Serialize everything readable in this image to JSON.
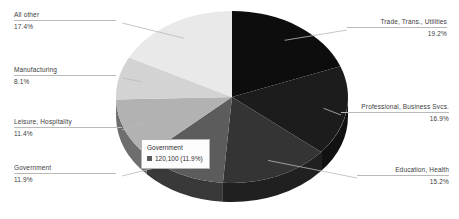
{
  "chart_data": {
    "type": "pie",
    "title": "",
    "subtitle": "",
    "legend_position": "callouts",
    "three_d": true,
    "categories": [
      "Trade, Trans., Utilities",
      "Professional, Business Svcs.",
      "Education, Health",
      "Government",
      "Leisure, Hospitality",
      "Manufacturing",
      "All other"
    ],
    "values": [
      19.2,
      16.9,
      15.2,
      11.9,
      11.4,
      8.1,
      17.4
    ],
    "value_labels": [
      "19.2%",
      "16.9%",
      "15.2%",
      "11.9%",
      "11.4%",
      "8.1%",
      "17.4%"
    ],
    "colors": [
      "#0d0d0d",
      "#1c1c1c",
      "#343434",
      "#5c5c5c",
      "#b2b2b2",
      "#d3d3d3",
      "#e9e9e9"
    ],
    "units": "percent of total"
  },
  "slices": [
    {
      "name": "Trade, Trans., Utilities",
      "pct": "19.2%",
      "color": "#0d0d0d",
      "side": "right"
    },
    {
      "name": "Professional, Business Svcs.",
      "pct": "16.9%",
      "color": "#1c1c1c",
      "side": "right"
    },
    {
      "name": "Education, Health",
      "pct": "15.2%",
      "color": "#343434",
      "side": "right"
    },
    {
      "name": "Government",
      "pct": "11.9%",
      "color": "#5c5c5c",
      "side": "left"
    },
    {
      "name": "Leisure, Hospitality",
      "pct": "11.4%",
      "color": "#b2b2b2",
      "side": "left"
    },
    {
      "name": "Manufacturing",
      "pct": "8.1%",
      "color": "#d3d3d3",
      "side": "left"
    },
    {
      "name": "All other",
      "pct": "17.4%",
      "color": "#e9e9e9",
      "side": "left"
    }
  ],
  "tooltip": {
    "title": "Government",
    "value": "120,100 (11.9%)",
    "swatch_color": "#5c5c5c"
  }
}
